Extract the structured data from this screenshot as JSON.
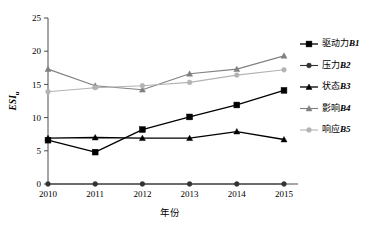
{
  "chart_data": {
    "type": "line",
    "title": "",
    "xlabel": "年份",
    "ylabel": "ESI",
    "ylabel_sub": "u",
    "categories": [
      "2010",
      "2011",
      "2012",
      "2013",
      "2014",
      "2015"
    ],
    "x": [
      2010,
      2011,
      2012,
      2013,
      2014,
      2015
    ],
    "ylim": [
      0,
      25
    ],
    "yticks": [
      "0",
      "5",
      "10",
      "15",
      "20",
      "25"
    ],
    "ytick_values": [
      0,
      5,
      10,
      15,
      20,
      25
    ],
    "grid": false,
    "legend_position": "right",
    "series": [
      {
        "name": "驱动力B1",
        "label_cn": "驱动力",
        "label_code": "B1",
        "marker": "square",
        "color": "#000000",
        "values": [
          6.6,
          4.8,
          8.2,
          10.1,
          11.9,
          14.1
        ]
      },
      {
        "name": "压力B2",
        "label_cn": "压力",
        "label_code": "B2",
        "marker": "circle",
        "color": "#333333",
        "values": [
          0,
          0,
          0,
          0,
          0,
          0
        ]
      },
      {
        "name": "状态B3",
        "label_cn": "状态",
        "label_code": "B3",
        "marker": "triangle",
        "color": "#000000",
        "values": [
          6.9,
          7.0,
          6.9,
          6.9,
          7.9,
          6.7
        ]
      },
      {
        "name": "影响B4",
        "label_cn": "影响",
        "label_code": "B4",
        "marker": "triangle",
        "color": "#808080",
        "values": [
          17.3,
          14.8,
          14.2,
          16.6,
          17.3,
          19.3
        ]
      },
      {
        "name": "响应B5",
        "label_cn": "响应",
        "label_code": "B5",
        "marker": "circle",
        "color": "#b3b3b3",
        "values": [
          13.9,
          14.5,
          14.8,
          15.3,
          16.4,
          17.2
        ]
      }
    ]
  },
  "legend": {
    "items": [
      {
        "label": "驱动力B1",
        "cn": "驱动力",
        "code": "B1"
      },
      {
        "label": "压力B2",
        "cn": "压力",
        "code": "B2"
      },
      {
        "label": "状态B3",
        "cn": "状态",
        "code": "B3"
      },
      {
        "label": "影响B4",
        "cn": "影响",
        "code": "B4"
      },
      {
        "label": "响应B5",
        "cn": "响应",
        "code": "B5"
      }
    ]
  },
  "axes": {
    "x_title": "年份",
    "y_title": "ESI",
    "y_title_sub": "u"
  }
}
